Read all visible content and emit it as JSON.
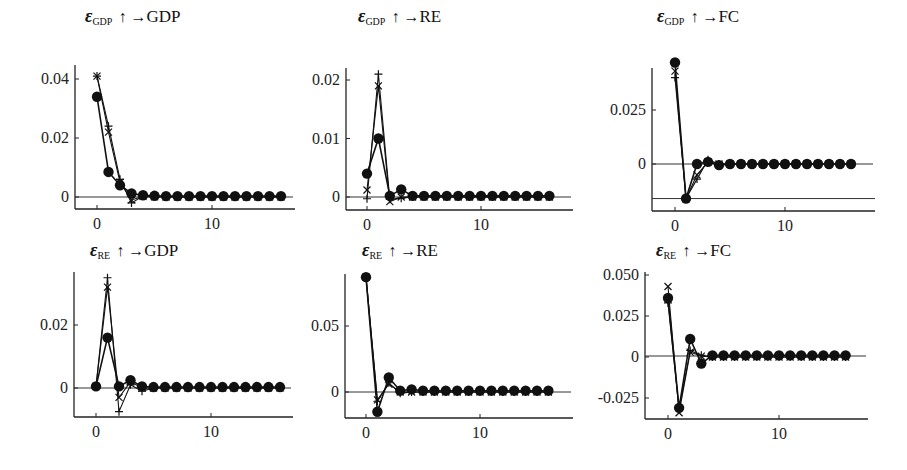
{
  "chart_data": [
    {
      "type": "line",
      "title": "ε_GDP ↑ → GDP",
      "title_parts": {
        "eps": "ε",
        "sub": "GDP",
        "arrow": "↑ →",
        "target": "GDP"
      },
      "xlabel": "",
      "ylabel": "",
      "x": [
        0,
        1,
        2,
        3,
        4,
        5,
        6,
        7,
        8,
        9,
        10,
        11,
        12,
        13,
        14,
        15,
        16
      ],
      "xticks": [
        0,
        10
      ],
      "yticks": [
        {
          "v": 0,
          "label": "0"
        },
        {
          "v": 0.02,
          "label": "0.02"
        },
        {
          "v": 0.04,
          "label": "0.04"
        }
      ],
      "ylim": [
        -0.004,
        0.043
      ],
      "xlim": [
        -2,
        18
      ],
      "extra_hlines": [],
      "series": [
        {
          "name": "dots",
          "marker": "circle",
          "values": [
            0.034,
            0.0085,
            0.004,
            0.0012,
            0.0006,
            0.0004,
            0.0003,
            0.0003,
            0.0003,
            0.0003,
            0.0003,
            0.0003,
            0.0003,
            0.0003,
            0.0003,
            0.0003,
            0.0003
          ]
        },
        {
          "name": "plus",
          "marker": "plus",
          "values": [
            0.041,
            0.024,
            0.006,
            -0.002,
            0.0003,
            0.0001,
            0,
            0,
            0,
            0,
            0,
            0,
            0,
            0,
            0,
            0,
            0
          ]
        },
        {
          "name": "cross",
          "marker": "x",
          "values": [
            0.041,
            0.022,
            0.005,
            -0.001,
            0.0002,
            0.0001,
            0,
            0,
            0,
            0,
            0,
            0,
            0,
            0,
            0,
            0,
            0
          ]
        }
      ],
      "grid": false
    },
    {
      "type": "line",
      "title": "ε_GDP ↑ → RE",
      "title_parts": {
        "eps": "ε",
        "sub": "GDP",
        "arrow": "↑ →",
        "target": "RE"
      },
      "xlabel": "",
      "ylabel": "",
      "x": [
        0,
        1,
        2,
        3,
        4,
        5,
        6,
        7,
        8,
        9,
        10,
        11,
        12,
        13,
        14,
        15,
        16
      ],
      "xticks": [
        0,
        10
      ],
      "yticks": [
        {
          "v": 0,
          "label": "0"
        },
        {
          "v": 0.01,
          "label": "0.01"
        },
        {
          "v": 0.02,
          "label": "0.02"
        }
      ],
      "ylim": [
        -0.002,
        0.022
      ],
      "xlim": [
        -2,
        18
      ],
      "extra_hlines": [],
      "series": [
        {
          "name": "dots",
          "marker": "circle",
          "values": [
            0.004,
            0.01,
            0.0002,
            0.0013,
            0.0002,
            0.0002,
            0.0002,
            0.0002,
            0.0002,
            0.0002,
            0.0002,
            0.0002,
            0.0002,
            0.0002,
            0.0002,
            0.0002,
            0.0002
          ]
        },
        {
          "name": "plus",
          "marker": "plus",
          "values": [
            -0.0003,
            0.021,
            -0.0004,
            -0.0002,
            0,
            0,
            0,
            0,
            0,
            0,
            0,
            0,
            0,
            0,
            0,
            0,
            0
          ]
        },
        {
          "name": "cross",
          "marker": "x",
          "values": [
            0.0012,
            0.019,
            -0.0008,
            0,
            0,
            0,
            0,
            0,
            0,
            0,
            0,
            0,
            0,
            0,
            0,
            0,
            0
          ]
        }
      ],
      "grid": false
    },
    {
      "type": "line",
      "title": "ε_GDP ↑ → FC",
      "title_parts": {
        "eps": "ε",
        "sub": "GDP",
        "arrow": "↑ →",
        "target": "FC"
      },
      "xlabel": "",
      "ylabel": "",
      "x": [
        0,
        1,
        2,
        3,
        4,
        5,
        6,
        7,
        8,
        9,
        10,
        11,
        12,
        13,
        14,
        15,
        16
      ],
      "xticks": [
        0,
        10
      ],
      "yticks": [
        {
          "v": 0,
          "label": "0"
        },
        {
          "v": 0.025,
          "label": "0.025"
        }
      ],
      "ylim": [
        -0.021,
        0.046
      ],
      "xlim": [
        -2,
        18
      ],
      "extra_hlines": [
        -0.016
      ],
      "series": [
        {
          "name": "dots",
          "marker": "circle",
          "values": [
            0.047,
            -0.016,
            0,
            0.001,
            -0.0005,
            0,
            0,
            0,
            0,
            0,
            0,
            0,
            0,
            0,
            0,
            0,
            0
          ]
        },
        {
          "name": "plus",
          "marker": "plus",
          "values": [
            0.04,
            -0.016,
            -0.007,
            0.002,
            0,
            0,
            0,
            0,
            0,
            0,
            0,
            0,
            0,
            0,
            0,
            0,
            0
          ]
        },
        {
          "name": "cross",
          "marker": "x",
          "values": [
            0.043,
            -0.016,
            -0.005,
            0.001,
            0,
            0,
            0,
            0,
            0,
            0,
            0,
            0,
            0,
            0,
            0,
            0,
            0
          ]
        }
      ],
      "grid": false
    },
    {
      "type": "line",
      "title": "ε_RE ↑ → GDP",
      "title_parts": {
        "eps": "ε",
        "sub": "RE",
        "arrow": "↑ →",
        "target": "GDP"
      },
      "xlabel": "",
      "ylabel": "",
      "x": [
        0,
        1,
        2,
        3,
        4,
        5,
        6,
        7,
        8,
        9,
        10,
        11,
        12,
        13,
        14,
        15,
        16
      ],
      "xticks": [
        0,
        10
      ],
      "yticks": [
        {
          "v": 0,
          "label": "0"
        },
        {
          "v": 0.02,
          "label": "0.02"
        }
      ],
      "ylim": [
        -0.008,
        0.036
      ],
      "xlim": [
        -2,
        18
      ],
      "extra_hlines": [],
      "series": [
        {
          "name": "dots",
          "marker": "circle",
          "values": [
            0.0005,
            0.016,
            0.0005,
            0.0025,
            0.0005,
            0.0003,
            0.0003,
            0.0003,
            0.0003,
            0.0003,
            0.0003,
            0.0003,
            0.0003,
            0.0003,
            0.0003,
            0.0003,
            0.0003
          ]
        },
        {
          "name": "plus",
          "marker": "plus",
          "values": [
            0.0005,
            0.035,
            -0.0075,
            0.001,
            -0.001,
            0,
            0,
            0,
            0,
            0,
            0,
            0,
            0,
            0,
            0,
            0,
            0
          ]
        },
        {
          "name": "cross",
          "marker": "x",
          "values": [
            0.0005,
            0.032,
            -0.003,
            0.002,
            0,
            0,
            0,
            0,
            0,
            0,
            0,
            0,
            0,
            0,
            0,
            0,
            0
          ]
        }
      ],
      "grid": false
    },
    {
      "type": "line",
      "title": "ε_RE ↑ → RE",
      "title_parts": {
        "eps": "ε",
        "sub": "RE",
        "arrow": "↑ →",
        "target": "RE"
      },
      "xlabel": "",
      "ylabel": "",
      "x": [
        0,
        1,
        2,
        3,
        4,
        5,
        6,
        7,
        8,
        9,
        10,
        11,
        12,
        13,
        14,
        15,
        16
      ],
      "xticks": [
        0,
        10
      ],
      "yticks": [
        {
          "v": 0,
          "label": "0"
        },
        {
          "v": 0.05,
          "label": "0.05"
        }
      ],
      "ylim": [
        -0.02,
        0.09
      ],
      "xlim": [
        -2,
        18
      ],
      "extra_hlines": [],
      "series": [
        {
          "name": "dots",
          "marker": "circle",
          "values": [
            0.087,
            -0.015,
            0.011,
            0.001,
            0.002,
            0.001,
            0.001,
            0.001,
            0.001,
            0.001,
            0.001,
            0.001,
            0.001,
            0.001,
            0.001,
            0.001,
            0.001
          ]
        },
        {
          "name": "plus",
          "marker": "plus",
          "values": [
            0.087,
            -0.007,
            0.007,
            -0.001,
            0,
            0,
            0,
            0,
            0,
            0,
            0,
            0,
            0,
            0,
            0,
            0,
            0
          ]
        },
        {
          "name": "cross",
          "marker": "x",
          "values": [
            0.087,
            -0.006,
            0.006,
            0,
            0,
            0,
            0,
            0,
            0,
            0,
            0,
            0,
            0,
            0,
            0,
            0,
            0
          ]
        }
      ],
      "grid": false
    },
    {
      "type": "line",
      "title": "ε_RE ↑ → FC",
      "title_parts": {
        "eps": "ε",
        "sub": "RE",
        "arrow": "↑ →",
        "target": "FC"
      },
      "xlabel": "",
      "ylabel": "",
      "x": [
        0,
        1,
        2,
        3,
        4,
        5,
        6,
        7,
        8,
        9,
        10,
        11,
        12,
        13,
        14,
        15,
        16
      ],
      "xticks": [
        0,
        10
      ],
      "yticks": [
        {
          "v": -0.025,
          "label": "-0.025"
        },
        {
          "v": 0,
          "label": "0"
        },
        {
          "v": 0.025,
          "label": "0.025"
        },
        {
          "v": 0.05,
          "label": "0.050"
        }
      ],
      "ylim": [
        -0.038,
        0.05
      ],
      "xlim": [
        -2,
        18
      ],
      "extra_hlines": [],
      "series": [
        {
          "name": "dots",
          "marker": "circle",
          "values": [
            0.036,
            -0.031,
            0.011,
            -0.004,
            0.001,
            0.001,
            0.001,
            0.001,
            0.001,
            0.001,
            0.001,
            0.001,
            0.001,
            0.001,
            0.001,
            0.001,
            0.001
          ]
        },
        {
          "name": "plus",
          "marker": "plus",
          "values": [
            0.033,
            -0.032,
            0.004,
            0.001,
            0,
            0,
            0,
            0,
            0,
            0,
            0,
            0,
            0,
            0,
            0,
            0,
            0
          ]
        },
        {
          "name": "cross",
          "marker": "x",
          "values": [
            0.043,
            -0.034,
            0.003,
            0.0005,
            0,
            0,
            0,
            0,
            0,
            0,
            0,
            0,
            0,
            0,
            0,
            0,
            0
          ]
        }
      ],
      "grid": false
    }
  ],
  "layout": {
    "panels": [
      {
        "left": 0,
        "top": 0,
        "title_x": 85,
        "title_y": 6,
        "ax_x": 75,
        "ax_top": 65,
        "ax_bottom": 209,
        "ax_right": 295,
        "x0px": 97,
        "x10px": 212
      },
      {
        "left": 0,
        "top": 0,
        "title_x": 358,
        "title_y": 6,
        "ax_x": 346,
        "ax_top": 68,
        "ax_bottom": 210,
        "ax_right": 573,
        "x0px": 367,
        "x10px": 481
      },
      {
        "left": 0,
        "top": 0,
        "title_x": 657,
        "title_y": 6,
        "ax_x": 652,
        "ax_top": 68,
        "ax_bottom": 211,
        "ax_right": 875,
        "x0px": 675,
        "x10px": 785
      },
      {
        "left": 0,
        "top": 0,
        "title_x": 90,
        "title_y": 240,
        "ax_x": 74,
        "ax_top": 272,
        "ax_bottom": 417,
        "ax_right": 293,
        "x0px": 96,
        "x10px": 211
      },
      {
        "left": 0,
        "top": 0,
        "title_x": 362,
        "title_y": 240,
        "ax_x": 345,
        "ax_top": 274,
        "ax_bottom": 418,
        "ax_right": 573,
        "x0px": 366,
        "x10px": 480
      },
      {
        "left": 0,
        "top": 0,
        "title_x": 656,
        "title_y": 240,
        "ax_x": 645,
        "ax_top": 272,
        "ax_bottom": 419,
        "ax_right": 868,
        "x0px": 668,
        "x10px": 779
      }
    ],
    "zero_px": [
      197,
      197,
      164,
      388,
      392,
      356
    ],
    "ytick_px": [
      {
        "0": 197,
        "0.02": 138,
        "0.04": 79
      },
      {
        "0": 197,
        "0.01": 138,
        "0.02": 80
      },
      {
        "0": 164,
        "0.025": 110
      },
      {
        "0": 388,
        "0.02": 325
      },
      {
        "0": 392,
        "0.05": 326
      },
      {
        "-0.025": 398,
        "0": 356,
        "0.025": 315,
        "0.05": 275
      }
    ]
  }
}
